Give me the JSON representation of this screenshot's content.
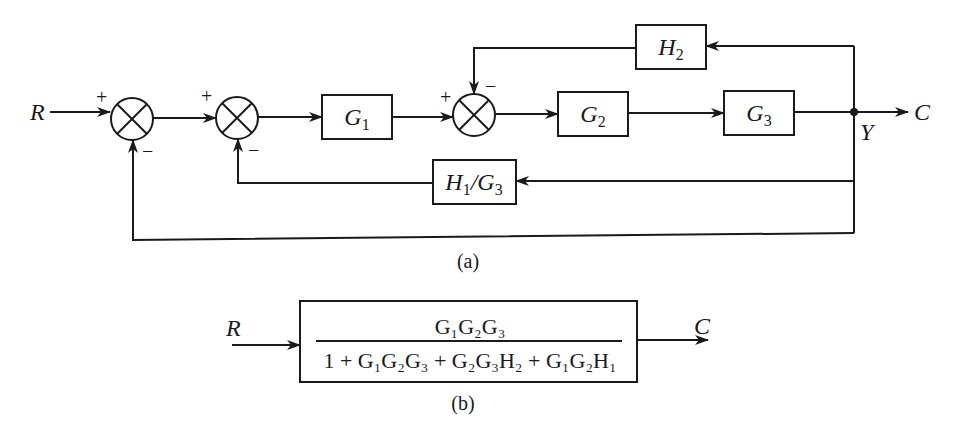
{
  "diagram_a": {
    "caption": "(a)",
    "input_label": "R",
    "output_label": "C",
    "node_label": "Y",
    "blocks": {
      "g1": {
        "sym": "G",
        "sub": "1"
      },
      "g2": {
        "sym": "G",
        "sub": "2"
      },
      "g3": {
        "sym": "G",
        "sub": "3"
      },
      "h2": {
        "sym": "H",
        "sub": "2"
      },
      "h1g3": {
        "sym1": "H",
        "sub1": "1",
        "slash": "/",
        "sym2": "G",
        "sub2": "3"
      }
    },
    "junctions": [
      {
        "id": "sum1",
        "plus": "+",
        "minus": "−"
      },
      {
        "id": "sum2",
        "plus": "+",
        "minus": "−"
      },
      {
        "id": "sum3",
        "plus": "+",
        "minus": "−"
      }
    ]
  },
  "diagram_b": {
    "caption": "(b)",
    "input_label": "R",
    "output_label": "C",
    "numerator": "G₁G₂G₃",
    "denominator": "1 + G₁G₂G₃ + G₂G₃H₂ + G₁G₂H₁"
  },
  "colors": {
    "ink": "#1a1a1a",
    "background": "#ffffff"
  }
}
